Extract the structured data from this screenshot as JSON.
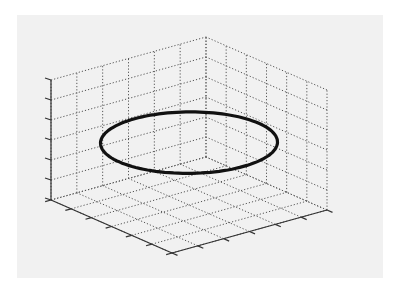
{
  "figure": {
    "background": "#ffffff",
    "panel_color": "#f1f1f1",
    "grid_color": "#555555",
    "axis_color": "#333333",
    "curve_color": "#111111"
  },
  "chart_data": {
    "type": "line3d",
    "title": "",
    "xlabel": "",
    "ylabel": "",
    "zlabel": "",
    "grid": true,
    "grid_style": "dotted",
    "tick_labels_visible": false,
    "x_divisions": 6,
    "y_divisions": 6,
    "z_divisions": 6,
    "series": [
      {
        "name": "circle",
        "shape": "circle in horizontal plane",
        "center": [
          0.5,
          0.5
        ],
        "radius": 0.45,
        "z": 0.52,
        "line_width": "thick"
      }
    ]
  }
}
